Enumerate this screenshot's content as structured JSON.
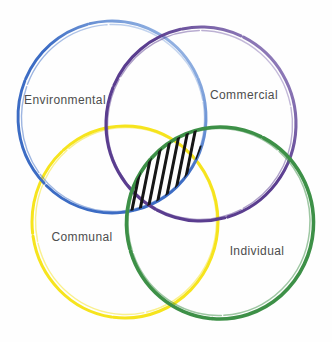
{
  "diagram": {
    "type": "venn-4-circles",
    "background_color": "#fefefe",
    "label_color": "#4d4d4d",
    "circles": [
      {
        "label": "Environmental",
        "color": "#3c6cc4",
        "position": "top-left"
      },
      {
        "label": "Commercial",
        "color": "#5a3d8f",
        "position": "top-right"
      },
      {
        "label": "Communal",
        "color": "#f6e41d",
        "position": "bottom-left"
      },
      {
        "label": "Individual",
        "color": "#3d9047",
        "position": "bottom-right"
      }
    ],
    "overlap_hatch": {
      "color": "#161616",
      "region": "environmental-individual-overlap",
      "style": "diagonal-strokes",
      "stroke_count": 8
    }
  }
}
